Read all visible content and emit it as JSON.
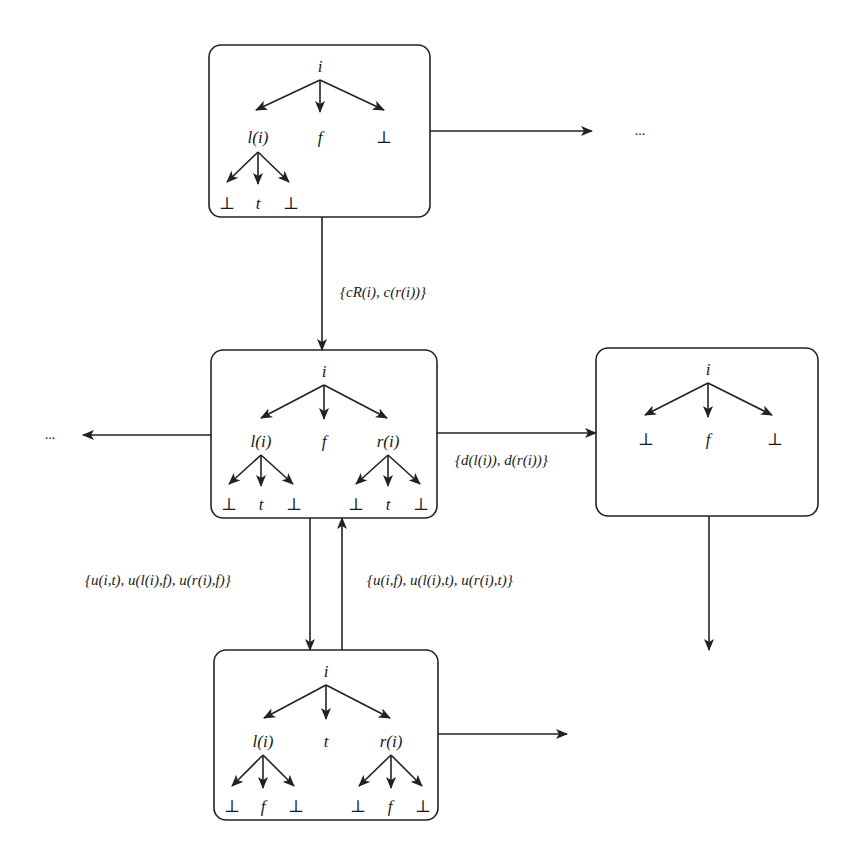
{
  "diagram": {
    "type": "state-transition-tree-diagram",
    "colors": {
      "stroke": "#222222",
      "background": "#ffffff",
      "text": "#1a1a1a"
    },
    "states": [
      {
        "id": "s1",
        "root": "i",
        "children": [
          {
            "label": "l(i)",
            "children": [
              "⊥",
              "t",
              "⊥"
            ]
          },
          {
            "label": "f"
          },
          {
            "label": "⊥"
          }
        ]
      },
      {
        "id": "s2",
        "root": "i",
        "children": [
          {
            "label": "l(i)",
            "children": [
              "⊥",
              "t",
              "⊥"
            ]
          },
          {
            "label": "f"
          },
          {
            "label": "r(i)",
            "children": [
              "⊥",
              "t",
              "⊥"
            ]
          }
        ]
      },
      {
        "id": "s3",
        "root": "i",
        "children": [
          {
            "label": "⊥"
          },
          {
            "label": "f"
          },
          {
            "label": "⊥"
          }
        ]
      },
      {
        "id": "s4",
        "root": "i",
        "children": [
          {
            "label": "l(i)",
            "children": [
              "⊥",
              "f",
              "⊥"
            ]
          },
          {
            "label": "t"
          },
          {
            "label": "r(i)",
            "children": [
              "⊥",
              "f",
              "⊥"
            ]
          }
        ]
      }
    ],
    "transitions": [
      {
        "from": "s1",
        "to": "s2",
        "label": "{cR(i), c(r(i))}"
      },
      {
        "from": "s2",
        "to": "s3",
        "label": "{d(l(i)), d(r(i))}"
      },
      {
        "from": "s2",
        "to": "s4",
        "label": "{u(i,t), u(l(i),f), u(r(i),f)}"
      },
      {
        "from": "s4",
        "to": "s2",
        "label": "{u(i,f), u(l(i),t), u(r(i),t)}"
      },
      {
        "from": "s1",
        "to": "continuation-right",
        "label": ""
      },
      {
        "from": "s2",
        "to": "continuation-left",
        "label": ""
      },
      {
        "from": "s3",
        "to": "continuation-down",
        "label": ""
      },
      {
        "from": "s4",
        "to": "continuation-right",
        "label": ""
      }
    ],
    "ellipsis_right": "...",
    "ellipsis_left": "..."
  }
}
